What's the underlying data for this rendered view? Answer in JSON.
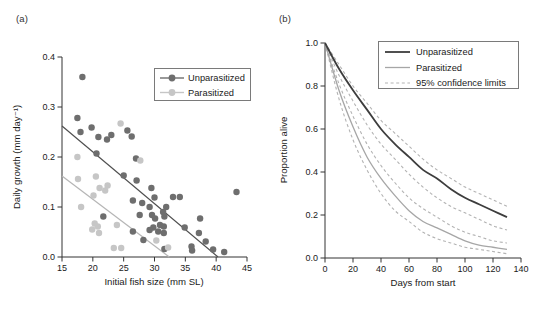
{
  "figure": {
    "panel_a_label": "(a)",
    "panel_b_label": "(b)"
  },
  "colors": {
    "axis": "#333333",
    "text": "#1a1a1a",
    "legend_border": "#7a7a7a",
    "unparasitized_point": "#6e6e6e",
    "unparasitized_line": "#4f4f4f",
    "parasitized_point": "#c6c6c6",
    "parasitized_line": "#b5b5b5",
    "survival_unparasitized": "#3d3d3d",
    "survival_parasitized": "#a6a6a6",
    "ci_dashed": "#b3b3b3"
  },
  "chart_data": [
    {
      "id": "a",
      "type": "scatter",
      "xlabel": "Initial fish size (mm SL)",
      "ylabel": "Daily growth (mm day⁻¹)",
      "xlim": [
        15,
        45
      ],
      "ylim": [
        0,
        0.4
      ],
      "xticks": [
        {
          "v": 15,
          "label": "15"
        },
        {
          "v": 20,
          "label": "20"
        },
        {
          "v": 25,
          "label": "25"
        },
        {
          "v": 30,
          "label": "30"
        },
        {
          "v": 35,
          "label": "35"
        },
        {
          "v": 40,
          "label": "40"
        },
        {
          "v": 45,
          "label": "45"
        }
      ],
      "yticks": [
        {
          "v": 0,
          "label": "0.0"
        },
        {
          "v": 0.1,
          "label": "0.1"
        },
        {
          "v": 0.2,
          "label": "0.2"
        },
        {
          "v": 0.3,
          "label": "0.3"
        },
        {
          "v": 0.4,
          "label": "0.4"
        }
      ],
      "grid": false,
      "legend_position": "top-right",
      "series": [
        {
          "name": "Unparasitized",
          "point_color": "#6e6e6e",
          "line_color": "#4f4f4f",
          "trend": [
            [
              15,
              0.262
            ],
            [
              40.3,
              0.0
            ]
          ],
          "points": [
            [
              18.3,
              0.36
            ],
            [
              17.5,
              0.278
            ],
            [
              18.0,
              0.25
            ],
            [
              19.8,
              0.259
            ],
            [
              20.9,
              0.24
            ],
            [
              22.3,
              0.235
            ],
            [
              23.0,
              0.244
            ],
            [
              25.6,
              0.253
            ],
            [
              26.3,
              0.241
            ],
            [
              20.6,
              0.207
            ],
            [
              27.0,
              0.197
            ],
            [
              25.0,
              0.163
            ],
            [
              27.1,
              0.153
            ],
            [
              29.5,
              0.138
            ],
            [
              30.0,
              0.119
            ],
            [
              26.5,
              0.113
            ],
            [
              28.0,
              0.108
            ],
            [
              29.2,
              0.1
            ],
            [
              21.7,
              0.081
            ],
            [
              27.6,
              0.084
            ],
            [
              29.6,
              0.084
            ],
            [
              33.0,
              0.12
            ],
            [
              34.1,
              0.12
            ],
            [
              31.9,
              0.1
            ],
            [
              31.4,
              0.09
            ],
            [
              31.6,
              0.081
            ],
            [
              30.1,
              0.077
            ],
            [
              30.9,
              0.064
            ],
            [
              29.8,
              0.059
            ],
            [
              31.5,
              0.061
            ],
            [
              30.6,
              0.051
            ],
            [
              26.5,
              0.051
            ],
            [
              29.2,
              0.054
            ],
            [
              31.5,
              0.048
            ],
            [
              28.2,
              0.034
            ],
            [
              34.9,
              0.059
            ],
            [
              37.4,
              0.077
            ],
            [
              37.2,
              0.048
            ],
            [
              38.3,
              0.031
            ],
            [
              36.0,
              0.021
            ],
            [
              36.1,
              0.013
            ],
            [
              31.6,
              0.016
            ],
            [
              39.5,
              0.015
            ],
            [
              41.3,
              0.01
            ],
            [
              43.3,
              0.13
            ]
          ]
        },
        {
          "name": "Parasitized",
          "point_color": "#c6c6c6",
          "line_color": "#b5b5b5",
          "trend": [
            [
              15,
              0.162
            ],
            [
              32.4,
              0.0
            ]
          ],
          "points": [
            [
              24.5,
              0.267
            ],
            [
              17.5,
              0.2
            ],
            [
              20.5,
              0.161
            ],
            [
              17.6,
              0.156
            ],
            [
              22.4,
              0.143
            ],
            [
              21.1,
              0.138
            ],
            [
              22.0,
              0.133
            ],
            [
              20.1,
              0.123
            ],
            [
              18.1,
              0.1
            ],
            [
              27.7,
              0.193
            ],
            [
              20.3,
              0.067
            ],
            [
              23.9,
              0.064
            ],
            [
              20.8,
              0.061
            ],
            [
              19.9,
              0.055
            ],
            [
              21.0,
              0.048
            ],
            [
              23.4,
              0.018
            ],
            [
              24.6,
              0.018
            ],
            [
              32.2,
              0.019
            ],
            [
              30.3,
              0.033
            ]
          ]
        }
      ],
      "legend_entries": [
        {
          "label": "Unparasitized",
          "marker_color": "#6e6e6e"
        },
        {
          "label": "Parasitized",
          "marker_color": "#c6c6c6"
        }
      ]
    },
    {
      "id": "b",
      "type": "line",
      "xlabel": "Days from start",
      "ylabel": "Proportion alive",
      "xlim": [
        0,
        140
      ],
      "ylim": [
        0,
        1.0
      ],
      "xticks": [
        {
          "v": 0,
          "label": "0"
        },
        {
          "v": 20,
          "label": "20"
        },
        {
          "v": 40,
          "label": "40"
        },
        {
          "v": 60,
          "label": "60"
        },
        {
          "v": 80,
          "label": "80"
        },
        {
          "v": 100,
          "label": "100"
        },
        {
          "v": 120,
          "label": "120"
        },
        {
          "v": 140,
          "label": "140"
        }
      ],
      "yticks": [
        {
          "v": 0,
          "label": "0.0"
        },
        {
          "v": 0.2,
          "label": "0.2"
        },
        {
          "v": 0.4,
          "label": "0.4"
        },
        {
          "v": 0.6,
          "label": "0.6"
        },
        {
          "v": 0.8,
          "label": "0.8"
        },
        {
          "v": 1.0,
          "label": "1.0"
        }
      ],
      "grid": false,
      "legend_position": "top-right",
      "x": [
        0,
        10,
        20,
        30,
        40,
        50,
        60,
        70,
        80,
        90,
        100,
        110,
        120,
        130
      ],
      "series": [
        {
          "name": "Unparasitized 95% CI upper",
          "style": "dashed",
          "color": "#b3b3b3",
          "width": 1.1,
          "in_legend": false,
          "values": [
            1.0,
            0.9,
            0.8,
            0.72,
            0.64,
            0.58,
            0.52,
            0.46,
            0.41,
            0.37,
            0.33,
            0.3,
            0.27,
            0.24
          ]
        },
        {
          "name": "Unparasitized 95% CI lower",
          "style": "dashed",
          "color": "#b3b3b3",
          "width": 1.1,
          "in_legend": false,
          "values": [
            1.0,
            0.85,
            0.73,
            0.62,
            0.53,
            0.46,
            0.39,
            0.33,
            0.28,
            0.24,
            0.21,
            0.18,
            0.15,
            0.13
          ]
        },
        {
          "name": "Parasitized 95% CI upper",
          "style": "dashed",
          "color": "#b3b3b3",
          "width": 1.1,
          "in_legend": false,
          "values": [
            1.0,
            0.81,
            0.66,
            0.53,
            0.43,
            0.35,
            0.28,
            0.23,
            0.19,
            0.15,
            0.12,
            0.1,
            0.08,
            0.07
          ]
        },
        {
          "name": "Parasitized 95% CI lower",
          "style": "dashed",
          "color": "#b3b3b3",
          "width": 1.1,
          "in_legend": false,
          "values": [
            1.0,
            0.74,
            0.55,
            0.41,
            0.3,
            0.22,
            0.17,
            0.12,
            0.09,
            0.07,
            0.05,
            0.04,
            0.03,
            0.02
          ]
        },
        {
          "name": "Parasitized",
          "style": "solid",
          "color": "#a6a6a6",
          "width": 1.3,
          "in_legend": true,
          "values": [
            1.0,
            0.78,
            0.61,
            0.47,
            0.37,
            0.29,
            0.22,
            0.17,
            0.14,
            0.11,
            0.08,
            0.06,
            0.05,
            0.04
          ]
        },
        {
          "name": "Unparasitized",
          "style": "solid",
          "color": "#3d3d3d",
          "width": 1.8,
          "in_legend": true,
          "values": [
            1.0,
            0.88,
            0.78,
            0.69,
            0.6,
            0.53,
            0.47,
            0.41,
            0.37,
            0.32,
            0.28,
            0.25,
            0.22,
            0.19
          ]
        }
      ],
      "legend_entries": [
        {
          "label": "Unparasitized",
          "style": "solid",
          "color": "#3d3d3d",
          "width": 1.8
        },
        {
          "label": "Parasitized",
          "style": "solid",
          "color": "#a6a6a6",
          "width": 1.3
        },
        {
          "label": "95% confidence limits",
          "style": "dashed",
          "color": "#b3b3b3",
          "width": 1.1
        }
      ]
    }
  ]
}
